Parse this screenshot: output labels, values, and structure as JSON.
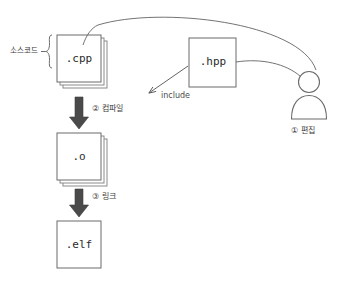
{
  "diagram": {
    "colors": {
      "box_stroke": "#6b6b6b",
      "box_fill": "#ffffff",
      "thin_arrow": "#5a5a5a",
      "thick_arrow": "#4a4a4a",
      "text": "#3a3a3a",
      "background": "#ffffff"
    },
    "nodes": [
      {
        "id": "cpp",
        "label": ".cpp",
        "shape": "file-stack",
        "copies": 3
      },
      {
        "id": "hpp",
        "label": ".hpp",
        "shape": "file-single",
        "copies": 1
      },
      {
        "id": "obj",
        "label": ".o",
        "shape": "file-stack",
        "copies": 3
      },
      {
        "id": "elf",
        "label": ".elf",
        "shape": "file-single",
        "copies": 1
      },
      {
        "id": "user",
        "label": "person-figure",
        "shape": "person",
        "copies": 1
      }
    ],
    "labels": {
      "source_code": "소스코드",
      "compile": "② 컴파일",
      "link": "③ 링크",
      "include": "include",
      "edit": "① 편집"
    },
    "edges": [
      {
        "from": "user",
        "to": "cpp",
        "style": "thin-curve",
        "label": ""
      },
      {
        "from": "user",
        "to": "hpp",
        "style": "thin-curve",
        "label": ""
      },
      {
        "from": "hpp",
        "to": "cpp",
        "style": "thin-straight",
        "label": "include"
      },
      {
        "from": "cpp",
        "to": "obj",
        "style": "thick-down",
        "label": "② 컴파일"
      },
      {
        "from": "obj",
        "to": "elf",
        "style": "thick-down",
        "label": "③ 링크"
      }
    ]
  }
}
